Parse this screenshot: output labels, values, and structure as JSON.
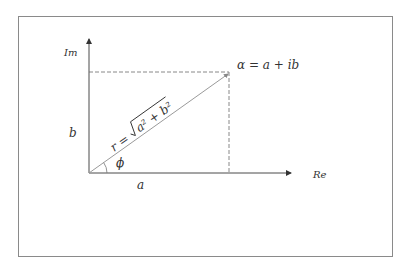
{
  "diagram": {
    "axes": {
      "imaginary_label": "Im",
      "real_label": "Re"
    },
    "point_label": "α = a + ib",
    "radius_label_prefix": "r =",
    "radius_label_radicand": "a² + b²",
    "angle_label": "ϕ",
    "real_component_label": "a",
    "imaginary_component_label": "b",
    "colors": {
      "axis": "#4a4a4a",
      "vector": "#9a9a9a",
      "dashed": "#6a6a6a",
      "text": "#333333",
      "frame": "#8a8a8a"
    }
  }
}
